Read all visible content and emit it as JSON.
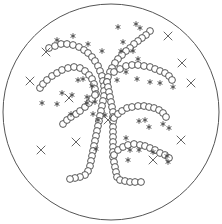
{
  "figure": {
    "width": 222,
    "height": 224,
    "plate": {
      "cx": 111,
      "cy": 112,
      "r": 108,
      "stroke": "#555555"
    },
    "colony_radius": 3.4,
    "symbols": {
      "circle": "colony-circle",
      "asterisk": "asterisk-mark",
      "cross": "x-mark"
    },
    "chains": [
      {
        "name": "upper-left-arc",
        "points": [
          [
            49,
            48
          ],
          [
            55,
            46
          ],
          [
            61,
            44
          ],
          [
            67,
            44
          ],
          [
            73,
            45
          ],
          [
            79,
            47
          ],
          [
            84,
            50
          ],
          [
            88,
            53
          ],
          [
            92,
            57
          ],
          [
            95,
            61
          ],
          [
            98,
            66
          ],
          [
            100,
            71
          ],
          [
            102,
            76
          ],
          [
            103,
            81
          ],
          [
            104,
            86
          ],
          [
            104,
            91
          ],
          [
            104,
            96
          ],
          [
            103,
            101
          ],
          [
            102,
            106
          ],
          [
            101,
            111
          ],
          [
            100,
            116
          ],
          [
            99,
            121
          ],
          [
            98,
            126
          ],
          [
            97,
            131
          ],
          [
            96,
            136
          ],
          [
            95,
            141
          ],
          [
            94,
            146
          ],
          [
            93,
            151
          ],
          [
            92,
            156
          ],
          [
            91,
            161
          ],
          [
            90,
            166
          ],
          [
            88,
            171
          ],
          [
            85,
            175
          ],
          [
            80,
            177
          ],
          [
            75,
            178
          ],
          [
            70,
            179
          ]
        ]
      },
      {
        "name": "middle-left-arc",
        "points": [
          [
            40,
            88
          ],
          [
            43,
            84
          ],
          [
            47,
            80
          ],
          [
            52,
            76
          ],
          [
            57,
            73
          ],
          [
            62,
            70
          ],
          [
            68,
            68
          ],
          [
            74,
            67
          ],
          [
            80,
            68
          ],
          [
            85,
            71
          ],
          [
            89,
            75
          ],
          [
            92,
            79
          ],
          [
            94,
            84
          ],
          [
            95,
            89
          ],
          [
            96,
            94
          ]
        ]
      },
      {
        "name": "lower-left-branch",
        "points": [
          [
            63,
            124
          ],
          [
            67,
            120
          ],
          [
            71,
            117
          ],
          [
            76,
            114
          ],
          [
            80,
            111
          ],
          [
            85,
            107
          ],
          [
            89,
            103
          ],
          [
            92,
            99
          ],
          [
            95,
            95
          ]
        ]
      },
      {
        "name": "upper-right-branch",
        "points": [
          [
            150,
            31
          ],
          [
            146,
            35
          ],
          [
            142,
            38
          ],
          [
            138,
            41
          ],
          [
            134,
            44
          ],
          [
            130,
            48
          ],
          [
            126,
            51
          ],
          [
            122,
            55
          ],
          [
            118,
            59
          ],
          [
            115,
            63
          ],
          [
            112,
            68
          ],
          [
            110,
            72
          ],
          [
            108,
            77
          ],
          [
            107,
            82
          ]
        ]
      },
      {
        "name": "right-trunk",
        "points": [
          [
            107,
            82
          ],
          [
            108,
            87
          ],
          [
            109,
            92
          ],
          [
            110,
            97
          ],
          [
            111,
            102
          ],
          [
            112,
            107
          ],
          [
            113,
            112
          ],
          [
            113,
            117
          ],
          [
            113,
            122
          ],
          [
            113,
            127
          ],
          [
            113,
            132
          ],
          [
            113,
            137
          ],
          [
            113,
            142
          ],
          [
            113,
            147
          ],
          [
            113,
            152
          ],
          [
            113,
            157
          ],
          [
            114,
            162
          ],
          [
            115,
            167
          ],
          [
            116,
            172
          ],
          [
            117,
            177
          ],
          [
            120,
            180
          ],
          [
            125,
            181
          ],
          [
            130,
            182
          ],
          [
            135,
            182
          ],
          [
            141,
            182
          ]
        ]
      },
      {
        "name": "middle-right-branch",
        "points": [
          [
            114,
            72
          ],
          [
            120,
            69
          ],
          [
            126,
            66
          ],
          [
            132,
            65
          ],
          [
            138,
            65
          ],
          [
            144,
            66
          ],
          [
            150,
            67
          ],
          [
            155,
            69
          ],
          [
            160,
            71
          ],
          [
            165,
            73
          ],
          [
            169,
            76
          ],
          [
            172,
            80
          ]
        ]
      },
      {
        "name": "lower-right-upper-branch",
        "points": [
          [
            114,
            118
          ],
          [
            118,
            114
          ],
          [
            122,
            111
          ],
          [
            127,
            108
          ],
          [
            132,
            107
          ],
          [
            138,
            106
          ],
          [
            144,
            106
          ],
          [
            149,
            107
          ],
          [
            154,
            108
          ],
          [
            159,
            110
          ],
          [
            163,
            113
          ],
          [
            166,
            117
          ]
        ]
      },
      {
        "name": "lower-right-lower-branch",
        "points": [
          [
            114,
            155
          ],
          [
            118,
            150
          ],
          [
            123,
            147
          ],
          [
            128,
            145
          ],
          [
            134,
            144
          ],
          [
            140,
            145
          ],
          [
            145,
            146
          ],
          [
            150,
            148
          ],
          [
            155,
            150
          ],
          [
            160,
            153
          ],
          [
            165,
            155
          ],
          [
            169,
            158
          ]
        ]
      }
    ],
    "asterisks": [
      [
        57,
        40
      ],
      [
        73,
        36
      ],
      [
        88,
        44
      ],
      [
        102,
        51
      ],
      [
        87,
        97
      ],
      [
        72,
        95
      ],
      [
        92,
        86
      ],
      [
        78,
        80
      ],
      [
        83,
        79
      ],
      [
        62,
        93
      ],
      [
        42,
        103
      ],
      [
        57,
        104
      ],
      [
        87,
        103
      ],
      [
        71,
        114
      ],
      [
        98,
        120
      ],
      [
        118,
        27
      ],
      [
        136,
        24
      ],
      [
        140,
        28
      ],
      [
        123,
        42
      ],
      [
        121,
        51
      ],
      [
        133,
        51
      ],
      [
        138,
        59
      ],
      [
        126,
        72
      ],
      [
        117,
        80
      ],
      [
        137,
        79
      ],
      [
        150,
        82
      ],
      [
        160,
        83
      ],
      [
        173,
        87
      ],
      [
        145,
        120
      ],
      [
        139,
        121
      ],
      [
        149,
        127
      ],
      [
        163,
        124
      ],
      [
        169,
        128
      ],
      [
        130,
        150
      ],
      [
        139,
        150
      ],
      [
        153,
        152
      ],
      [
        167,
        156
      ],
      [
        128,
        160
      ],
      [
        168,
        162
      ],
      [
        93,
        114
      ],
      [
        105,
        115
      ],
      [
        95,
        102
      ],
      [
        96,
        149
      ],
      [
        126,
        138
      ]
    ],
    "crosses": [
      [
        46,
        52
      ],
      [
        30,
        81
      ],
      [
        69,
        98
      ],
      [
        108,
        120
      ],
      [
        41,
        150
      ],
      [
        76,
        142
      ],
      [
        168,
        36
      ],
      [
        182,
        63
      ],
      [
        191,
        83
      ],
      [
        181,
        140
      ],
      [
        153,
        160
      ]
    ]
  }
}
